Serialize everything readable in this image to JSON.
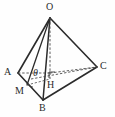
{
  "figure": {
    "background_color": "#fefefe",
    "stroke_color": "#2b2b2b",
    "label_color": "#2b2b2b",
    "width": 115,
    "height": 117
  },
  "labels": {
    "O": "O",
    "A": "A",
    "B": "B",
    "C": "C",
    "M": "M",
    "H": "H",
    "theta": "θ"
  },
  "points": {
    "O": {
      "x": 50,
      "y": 18,
      "label": "O"
    },
    "A": {
      "x": 18,
      "y": 73,
      "label": "A"
    },
    "B": {
      "x": 43,
      "y": 100,
      "label": "B"
    },
    "C": {
      "x": 97,
      "y": 67,
      "label": "C"
    },
    "H": {
      "x": 50,
      "y": 79,
      "label": "H"
    },
    "M": {
      "x": 27,
      "y": 85,
      "label": "M"
    }
  },
  "label_positions": {
    "O": {
      "x": 46,
      "y": 3
    },
    "A": {
      "x": 4,
      "y": 68
    },
    "B": {
      "x": 39,
      "y": 103
    },
    "C": {
      "x": 100,
      "y": 62
    },
    "M": {
      "x": 15,
      "y": 87
    },
    "H": {
      "x": 47,
      "y": 81
    },
    "theta": {
      "x": 33,
      "y": 69
    }
  },
  "edges": [
    {
      "name": "edge-OA",
      "from": "O",
      "to": "A",
      "style": "solid"
    },
    {
      "name": "edge-OB",
      "from": "O",
      "to": "B",
      "style": "solid"
    },
    {
      "name": "edge-OC",
      "from": "O",
      "to": "C",
      "style": "solid"
    },
    {
      "name": "edge-OM",
      "from": "O",
      "to": "M",
      "style": "solid"
    },
    {
      "name": "edge-AB",
      "from": "A",
      "to": "B",
      "style": "solid"
    },
    {
      "name": "edge-BC",
      "from": "B",
      "to": "C",
      "style": "solid"
    },
    {
      "name": "edge-AH",
      "from": "A",
      "to": "H",
      "style": "dashed"
    },
    {
      "name": "edge-HC",
      "from": "H",
      "to": "C",
      "style": "dashed"
    },
    {
      "name": "edge-OH",
      "from": "O",
      "to": "H",
      "style": "dashed"
    },
    {
      "name": "edge-MH",
      "from": "M",
      "to": "H",
      "style": "dashed"
    },
    {
      "name": "edge-MC",
      "from": "M",
      "to": "C",
      "style": "dashed"
    }
  ],
  "marks": {
    "right_angle": {
      "name": "right-angle-mark-H",
      "x": 49,
      "y": 72,
      "size": 5
    },
    "angle_arc": {
      "name": "angle-arc-theta",
      "cx": 30,
      "cy": 80,
      "radius": 7
    }
  }
}
